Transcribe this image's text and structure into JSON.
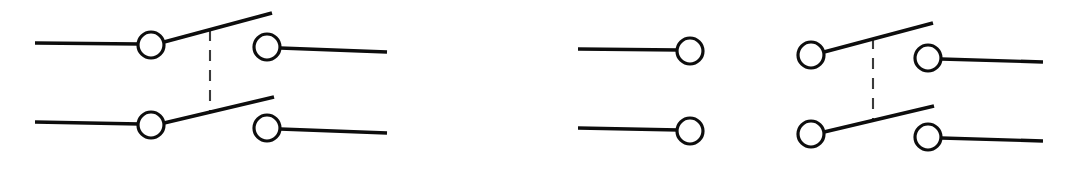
{
  "figure": {
    "background_color": "#ffffff",
    "line_color": "#0d0d0d",
    "gang_link_color": "#3a3a3a",
    "terminal_fill": "#ffffff",
    "canvas": {
      "width": 1069,
      "height": 169
    }
  },
  "symbols": [
    {
      "id": "switch-left",
      "name": "double-pole-switch-left",
      "gang_link": {
        "x": 210,
        "y1": 30,
        "y2": 112
      },
      "poles": [
        {
          "id": "pole-left-top",
          "name": "pole-top",
          "lead_in": {
            "x1": 35,
            "y1": 43,
            "x2": 140,
            "y2": 44
          },
          "pivot_terminal": {
            "cx": 151,
            "cy": 45,
            "r": 13
          },
          "lever": {
            "x1": 164,
            "y1": 42,
            "x2": 272,
            "y2": 13
          },
          "contact_terminal": {
            "cx": 267,
            "cy": 47,
            "r": 13
          },
          "lead_out": {
            "x1": 280,
            "y1": 48,
            "x2": 387,
            "y2": 52
          }
        },
        {
          "id": "pole-left-bottom",
          "name": "pole-bottom",
          "lead_in": {
            "x1": 35,
            "y1": 122,
            "x2": 140,
            "y2": 124
          },
          "pivot_terminal": {
            "cx": 151,
            "cy": 125,
            "r": 13
          },
          "lever": {
            "x1": 164,
            "y1": 123,
            "x2": 274,
            "y2": 97
          },
          "contact_terminal": {
            "cx": 267,
            "cy": 128,
            "r": 13
          },
          "lead_out": {
            "x1": 280,
            "y1": 129,
            "x2": 387,
            "y2": 133
          }
        }
      ]
    },
    {
      "id": "switch-right",
      "name": "double-pole-switch-right",
      "gang_link": {
        "x": 873,
        "y1": 38,
        "y2": 121
      },
      "open_poles": [
        {
          "id": "pole-right-open-top",
          "name": "open-pole-top",
          "lead_in": {
            "x1": 578,
            "y1": 49,
            "x2": 679,
            "y2": 50
          },
          "terminal": {
            "cx": 690,
            "cy": 51,
            "r": 13
          }
        },
        {
          "id": "pole-right-open-bottom",
          "name": "open-pole-bottom",
          "lead_in": {
            "x1": 578,
            "y1": 128,
            "x2": 679,
            "y2": 130
          },
          "terminal": {
            "cx": 690,
            "cy": 131,
            "r": 13
          }
        }
      ],
      "poles": [
        {
          "id": "pole-right-top",
          "name": "pole-top",
          "pivot_terminal": {
            "cx": 811,
            "cy": 55,
            "r": 13
          },
          "lever": {
            "x1": 824,
            "y1": 52,
            "x2": 933,
            "y2": 23
          },
          "contact_terminal": {
            "cx": 928,
            "cy": 58,
            "r": 13
          },
          "lead_out": {
            "x1": 941,
            "y1": 59,
            "x2": 1043,
            "y2": 62
          }
        },
        {
          "id": "pole-right-bottom",
          "name": "pole-bottom",
          "pivot_terminal": {
            "cx": 811,
            "cy": 134,
            "r": 13
          },
          "lever": {
            "x1": 824,
            "y1": 132,
            "x2": 934,
            "y2": 106
          },
          "contact_terminal": {
            "cx": 928,
            "cy": 137,
            "r": 13
          },
          "lead_out": {
            "x1": 941,
            "y1": 138,
            "x2": 1043,
            "y2": 141
          }
        }
      ]
    }
  ]
}
